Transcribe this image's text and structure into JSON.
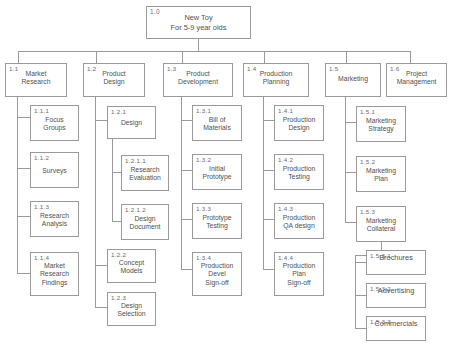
{
  "diagram": {
    "root": {
      "code": "1.0",
      "label": "New Toy\nFor 5-9 year olds",
      "line1": "New Toy",
      "line2": "For 5-9 year olds"
    },
    "level2": [
      {
        "code": "1.1",
        "line1": "Market",
        "line2": "Research"
      },
      {
        "code": "1.2",
        "line1": "Product",
        "line2": "Design"
      },
      {
        "code": "1.3",
        "line1": "Product",
        "line2": "Development"
      },
      {
        "code": "1.4",
        "line1": "Production",
        "line2": "Planning"
      },
      {
        "code": "1.5",
        "line1": "Marketing",
        "line2": ""
      },
      {
        "code": "1.6",
        "line1": "Project",
        "line2": "Management"
      }
    ],
    "branch_market_research": [
      {
        "code": "1.1.1",
        "line1": "Focus",
        "line2": "Groups",
        "line3": "",
        "line4": ""
      },
      {
        "code": "1.1.2",
        "line1": "Surveys",
        "line2": "",
        "line3": "",
        "line4": ""
      },
      {
        "code": "1.1.3",
        "line1": "Research",
        "line2": "Analysis",
        "line3": "",
        "line4": ""
      },
      {
        "code": "1.1.4",
        "line1": "Market",
        "line2": "Research",
        "line3": "Findings",
        "line4": ""
      }
    ],
    "branch_product_design": [
      {
        "code": "1.2.1",
        "line1": "Design",
        "line2": ""
      },
      {
        "code": "1.2.2",
        "line1": "Concept",
        "line2": "Models"
      },
      {
        "code": "1.2.3",
        "line1": "Design",
        "line2": "Selection"
      }
    ],
    "branch_design_sub": [
      {
        "code": "1.2.1.1",
        "line1": "Research",
        "line2": "Evaluation"
      },
      {
        "code": "1.2.1.2",
        "line1": "Design",
        "line2": "Document"
      }
    ],
    "branch_product_development": [
      {
        "code": "1.3.1",
        "line1": "Bill of",
        "line2": "Materials",
        "line3": ""
      },
      {
        "code": "1.3.2",
        "line1": "Initial",
        "line2": "Prototype",
        "line3": ""
      },
      {
        "code": "1.3.3",
        "line1": "Prototype",
        "line2": "Testing",
        "line3": ""
      },
      {
        "code": "1.3.4",
        "line1": "Production",
        "line2": "Devel",
        "line3": "Sign-off"
      }
    ],
    "branch_production_planning": [
      {
        "code": "1.4.1",
        "line1": "Production",
        "line2": "Design",
        "line3": ""
      },
      {
        "code": "1.4.2",
        "line1": "Production",
        "line2": "Testing",
        "line3": ""
      },
      {
        "code": "1.4.3",
        "line1": "Production",
        "line2": "QA design",
        "line3": ""
      },
      {
        "code": "1.4.4",
        "line1": "Production",
        "line2": "Plan",
        "line3": "Sign-off"
      }
    ],
    "branch_marketing": [
      {
        "code": "1.5.1",
        "line1": "Marketing",
        "line2": "Strategy"
      },
      {
        "code": "1.5.2",
        "line1": "Marketing",
        "line2": "Plan"
      },
      {
        "code": "1.5.3",
        "line1": "Marketing",
        "line2": "Collateral"
      }
    ],
    "branch_marketing_collateral": [
      {
        "code": "1.5.3.1",
        "line1": "Brochures"
      },
      {
        "code": "1.5.3.2",
        "line1": "Advertising"
      },
      {
        "code": "1.5.3.3",
        "line1": "Commercials"
      }
    ],
    "colors": {
      "border": "#9a9a9a",
      "text": "#4f4f4f",
      "code_text": "#6b6b6b",
      "background": "#ffffff"
    }
  }
}
